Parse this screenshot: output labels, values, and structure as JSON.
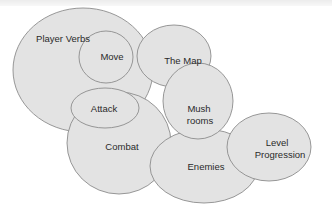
{
  "diagram": {
    "type": "bubble-concept-map",
    "colors": {
      "fill": "#e3e3e3",
      "stroke": "#8c8c8c",
      "text": "#2a2a2a",
      "background": "#ffffff"
    },
    "nodes": [
      {
        "id": "player_verbs",
        "label": "Player Verbs"
      },
      {
        "id": "move",
        "label": "Move"
      },
      {
        "id": "the_map",
        "label": "The Map"
      },
      {
        "id": "attack",
        "label": "Attack"
      },
      {
        "id": "combat",
        "label": "Combat"
      },
      {
        "id": "mushrooms",
        "label_line1": "Mush",
        "label_line2": "rooms"
      },
      {
        "id": "enemies",
        "label": "Enemies"
      },
      {
        "id": "level_progression",
        "label_line1": "Level",
        "label_line2": "Progression"
      }
    ]
  }
}
